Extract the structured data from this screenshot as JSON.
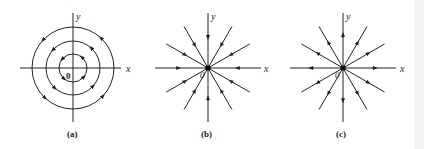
{
  "figure": {
    "panels": [
      {
        "id": "a",
        "caption": "(a)",
        "type": "center",
        "origin_label": "0",
        "x_label": "x",
        "y_label": "y",
        "center": [
          73,
          68
        ],
        "circle_radii": [
          14,
          27,
          41
        ],
        "flow": "counterclockwise"
      },
      {
        "id": "b",
        "caption": "(b)",
        "type": "stable-star-node",
        "origin_label": "0",
        "x_label": "x",
        "y_label": "y",
        "center": [
          208,
          68
        ],
        "ray_angles_deg": [
          0,
          30,
          60,
          90,
          120,
          150,
          180,
          210,
          240,
          270,
          300,
          330
        ],
        "flow": "inward"
      },
      {
        "id": "c",
        "caption": "(c)",
        "type": "unstable-star-node",
        "origin_label": "0",
        "x_label": "x",
        "y_label": "y",
        "center": [
          343,
          68
        ],
        "ray_angles_deg": [
          0,
          30,
          60,
          90,
          120,
          150,
          180,
          210,
          240,
          270,
          300,
          330
        ],
        "flow": "outward"
      }
    ],
    "colors": {
      "ink": "#222222",
      "background": "#ffffff"
    }
  }
}
